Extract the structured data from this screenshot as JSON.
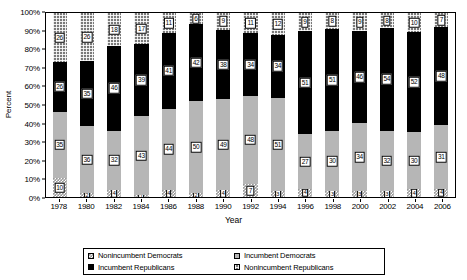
{
  "chart_data": {
    "type": "bar",
    "subtype": "stacked-100-percent",
    "title": "",
    "xlabel": "Year",
    "ylabel": "Percent",
    "ylim": [
      0,
      100
    ],
    "ytick_labels": [
      "0%",
      "10%",
      "20%",
      "30%",
      "40%",
      "50%",
      "60%",
      "70%",
      "80%",
      "90%",
      "100%"
    ],
    "ytick_values": [
      0,
      10,
      20,
      30,
      40,
      50,
      60,
      70,
      80,
      90,
      100
    ],
    "grid": false,
    "legend_position": "bottom",
    "categories": [
      1978,
      1980,
      1982,
      1984,
      1986,
      1988,
      1990,
      1992,
      1994,
      1996,
      1998,
      2000,
      2002,
      2004,
      2006
    ],
    "series": [
      {
        "name": "Nonincumbent Democrats",
        "fill": "checkered",
        "values": [
          10,
          2,
          4,
          1,
          4,
          2,
          4,
          7,
          3,
          4,
          3,
          3,
          3,
          4,
          4
        ],
        "labels": [
          "10",
          "2",
          "4",
          "1",
          "4",
          "2",
          "4",
          "7",
          "3",
          "4",
          "3",
          "3",
          "3",
          "4",
          "4"
        ]
      },
      {
        "name": "Incumbent Democrats",
        "fill": "light-gray",
        "values": [
          35,
          36,
          32,
          43,
          44,
          50,
          49,
          48,
          51,
          27,
          30,
          34,
          32,
          30,
          31
        ],
        "labels": [
          "35",
          "36",
          "32",
          "43",
          "44",
          "50",
          "49",
          "48",
          "51",
          "27",
          "30",
          "34",
          "32",
          "30",
          "31"
        ]
      },
      {
        "name": "Incumbent Republicans",
        "fill": "black",
        "values": [
          26,
          35,
          46,
          39,
          41,
          42,
          38,
          34,
          34,
          51,
          51,
          46,
          54,
          52,
          48
        ],
        "labels": [
          "26",
          "35",
          "46",
          "39",
          "41",
          "42",
          "38",
          "34",
          "34",
          "51",
          "51",
          "46",
          "54",
          "52",
          "48"
        ]
      },
      {
        "name": "Nonincumbent Republicans",
        "fill": "dark-gray-grid",
        "values": [
          26,
          26,
          18,
          17,
          11,
          6,
          9,
          11,
          12,
          9,
          8,
          9,
          8,
          10,
          7
        ],
        "labels": [
          "26",
          "26",
          "18",
          "17",
          "11",
          "6",
          "9",
          "11",
          "12",
          "9",
          "8",
          "9",
          "8",
          "10",
          "7"
        ]
      }
    ]
  },
  "legend": {
    "items": [
      {
        "label": "Nonincumbent Democrats",
        "fill": "checkered"
      },
      {
        "label": "Incumbent Democrats",
        "fill": "light-gray"
      },
      {
        "label": "Incumbent Republicans",
        "fill": "black"
      },
      {
        "label": "Nonincumbent Republicans",
        "fill": "dark-gray-grid"
      }
    ]
  },
  "colors": {
    "nonincumbent_democrats": "#9a9a9a",
    "incumbent_democrats": "#b6b6b6",
    "incumbent_republicans": "#000000",
    "nonincumbent_republicans": "#7a7a7a",
    "axis": "#000000",
    "background": "#ffffff"
  }
}
